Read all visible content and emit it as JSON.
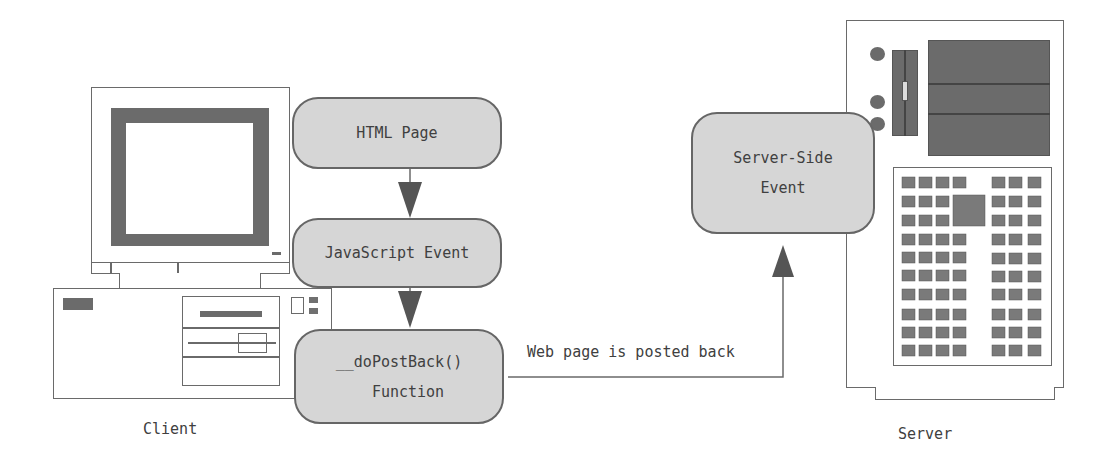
{
  "diagram": {
    "type": "flow",
    "nodes": {
      "html_page": {
        "label": "HTML Page"
      },
      "js_event": {
        "label": "JavaScript Event"
      },
      "dopostback": {
        "line1": "__doPostBack()",
        "line2": "Function"
      },
      "server_event": {
        "line1": "Server-Side",
        "line2": "Event"
      }
    },
    "edges": {
      "postback_label": "Web page is posted back"
    },
    "captions": {
      "client": "Client",
      "server": "Server"
    },
    "icons": {
      "client": "desktop-computer-icon",
      "server": "server-tower-icon"
    },
    "colors": {
      "node_fill": "#d6d6d6",
      "node_border": "#666666",
      "dark_fill": "#6b6b6b",
      "line": "#6a6a6a"
    }
  }
}
